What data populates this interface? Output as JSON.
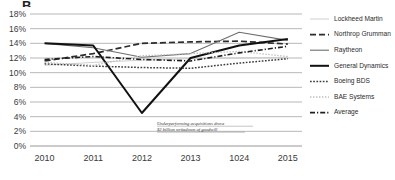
{
  "title_fragment": "B",
  "chart_data": {
    "type": "line",
    "title": "",
    "subtitle": "",
    "xlabel": "",
    "ylabel": "",
    "x": [
      "2010",
      "2011",
      "2012",
      "2013",
      "1024",
      "2015"
    ],
    "categories": [
      "2010",
      "2011",
      "2012",
      "2013",
      "1024",
      "2015"
    ],
    "xtick_labels": [
      "2010",
      "2011",
      "2012",
      "2013",
      "1024",
      "2015"
    ],
    "ytick_labels": [
      "0%",
      "2%",
      "4%",
      "6%",
      "8%",
      "10%",
      "12%",
      "14%",
      "16%",
      "18%"
    ],
    "ytick_values": [
      0,
      2,
      4,
      6,
      8,
      10,
      12,
      14,
      16,
      18
    ],
    "ylim": [
      0,
      18
    ],
    "y_unit": "%",
    "grid": true,
    "legend_position": "right",
    "series": [
      {
        "name": "Lockheed Martin",
        "style": "solid-thin-light",
        "color": "#c9c9c9",
        "values": [
          11.0,
          11.4,
          11.7,
          11.9,
          12.0,
          12.1
        ]
      },
      {
        "name": "Northrop Grumman",
        "style": "dashed",
        "color": "#2b2b2b",
        "values": [
          11.6,
          12.6,
          14.0,
          14.2,
          14.3,
          13.9
        ]
      },
      {
        "name": "Raytheon",
        "style": "solid-medium",
        "color": "#6e6e6e",
        "values": [
          14.0,
          13.4,
          12.1,
          12.6,
          15.5,
          14.4
        ]
      },
      {
        "name": "General Dynamics",
        "style": "solid-thick",
        "color": "#111111",
        "values": [
          14.0,
          13.7,
          4.5,
          12.0,
          13.7,
          14.6
        ]
      },
      {
        "name": "Boeing BDS",
        "style": "dotted-dark",
        "color": "#3d3d3d",
        "values": [
          11.2,
          10.9,
          10.7,
          10.6,
          11.3,
          11.9
        ]
      },
      {
        "name": "BAE Systems",
        "style": "dotted-light",
        "color": "#bdbdbd",
        "values": [
          11.4,
          11.0,
          12.3,
          12.6,
          12.9,
          12.2
        ]
      },
      {
        "name": "Average",
        "style": "dash-dot",
        "color": "#1f1f1f",
        "values": [
          11.8,
          12.2,
          11.8,
          11.6,
          12.7,
          13.6
        ]
      }
    ],
    "annotations": [
      {
        "line1": "Underperforming acquisitions drove",
        "line2": "$2 billion writedown of goodwill",
        "target_x": "2012",
        "target_y": 4.5
      }
    ]
  },
  "legend": {
    "items": [
      {
        "label": "Lockheed Martin"
      },
      {
        "label": "Northrop Grumman"
      },
      {
        "label": "Raytheon"
      },
      {
        "label": "General Dynamics"
      },
      {
        "label": "Boeing BDS"
      },
      {
        "label": "BAE Systems"
      },
      {
        "label": "Average"
      }
    ]
  }
}
